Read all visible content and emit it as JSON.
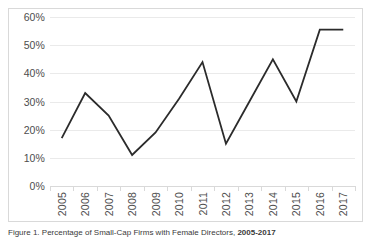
{
  "figure": {
    "caption_prefix": "Figure 1. Percentage of Small-Cap Firms with Female Directors, ",
    "caption_bold": "2005-2017"
  },
  "chart_data": {
    "type": "line",
    "title": "",
    "subtitle": "",
    "xlabel": "",
    "ylabel": "",
    "categories": [
      "2005",
      "2006",
      "2007",
      "2008",
      "2009",
      "2010",
      "2011",
      "2012",
      "2013",
      "2014",
      "2015",
      "2016",
      "2017"
    ],
    "values": [
      17,
      33,
      25,
      11,
      19,
      31,
      44,
      15,
      30,
      45,
      30,
      55.5,
      55.5
    ],
    "ylim": [
      0,
      60
    ],
    "ytick_labels": [
      "0%",
      "10%",
      "20%",
      "30%",
      "40%",
      "50%",
      "60%"
    ],
    "ytick_values": [
      0,
      10,
      20,
      30,
      40,
      50,
      60
    ],
    "grid": true,
    "legend": false,
    "legend_position": "none",
    "series": [
      {
        "name": "Percentage",
        "values": [
          17,
          33,
          25,
          11,
          19,
          31,
          44,
          15,
          30,
          45,
          30,
          55.5,
          55.5
        ]
      }
    ],
    "colors": {
      "line": "#2b2b2b",
      "gridline": "#eaeaea",
      "axis": "#d9d9d9",
      "tick_text": "#4d4d4d",
      "plot_background": "#ffffff"
    },
    "line_width": 1.8
  }
}
